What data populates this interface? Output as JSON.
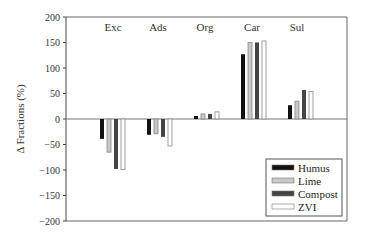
{
  "chart_data": {
    "type": "bar",
    "title": "",
    "xlabel": "",
    "ylabel": "Δ Fractions (%)",
    "ylim": [
      -200,
      200
    ],
    "yticks": [
      200,
      150,
      100,
      50,
      0,
      -50,
      -100,
      -150,
      -200
    ],
    "grid": false,
    "legend_position": "lower right",
    "categories": [
      "Exc",
      "Ads",
      "Org",
      "Car",
      "Sul"
    ],
    "series": [
      {
        "name": "Humus",
        "color": "#111111",
        "values": [
          -39,
          -31,
          6,
          127,
          27
        ]
      },
      {
        "name": "Lime",
        "color": "#c8c8c8",
        "values": [
          -65,
          -29,
          10,
          150,
          35
        ]
      },
      {
        "name": "Compost",
        "color": "#444444",
        "values": [
          -98,
          -35,
          10,
          150,
          57
        ]
      },
      {
        "name": "ZVI",
        "color": "#ffffff",
        "values": [
          -99,
          -53,
          14,
          153,
          54
        ]
      }
    ]
  }
}
